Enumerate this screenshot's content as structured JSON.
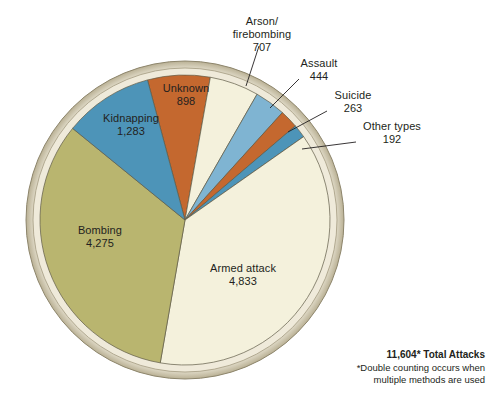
{
  "chart_data": {
    "type": "pie",
    "title": "",
    "total_label": "11,604* Total Attacks",
    "total_value": 11604,
    "footnote": "*Double counting occurs when multiple methods are used",
    "categories": [
      "Unknown",
      "Arson/firebombing",
      "Assault",
      "Suicide",
      "Other types",
      "Armed attack",
      "Bombing",
      "Kidnapping"
    ],
    "values": [
      898,
      707,
      444,
      263,
      192,
      4833,
      4275,
      1283
    ],
    "value_labels": [
      "898",
      "707",
      "444",
      "263",
      "192",
      "4,833",
      "4,275",
      "1,283"
    ],
    "colors": [
      "#c4682f",
      "#f4f1dc",
      "#7fb4d2",
      "#c4682f",
      "#4d94b8",
      "#f4f1dc",
      "#b9b56f",
      "#4d94b8"
    ],
    "legend": "none",
    "grid": false
  },
  "slices": [
    {
      "name": "unknown",
      "label": "Unknown",
      "value_label": "898",
      "value": 898,
      "color": "#c4682f",
      "label_x": 185,
      "label_y": 88,
      "inside": true
    },
    {
      "name": "arson-firebombing",
      "label": "Arson/",
      "label2": "firebombing",
      "value_label": "707",
      "value": 707,
      "color": "#f4f1dc",
      "inside": false
    },
    {
      "name": "assault",
      "label": "Assault",
      "value_label": "444",
      "value": 444,
      "color": "#7fb4d2",
      "inside": false
    },
    {
      "name": "suicide",
      "label": "Suicide",
      "value_label": "263",
      "value": 263,
      "color": "#c4682f",
      "inside": false
    },
    {
      "name": "other-types",
      "label": "Other types",
      "value_label": "192",
      "value": 192,
      "color": "#4d94b8",
      "inside": false
    },
    {
      "name": "armed-attack",
      "label": "Armed attack",
      "value_label": "4,833",
      "value": 4833,
      "color": "#f4f1dc",
      "label_x": 243,
      "label_y": 267,
      "inside": true
    },
    {
      "name": "bombing",
      "label": "Bombing",
      "value_label": "4,275",
      "value": 4275,
      "color": "#b9b56f",
      "label_x": 100,
      "label_y": 228,
      "inside": true
    },
    {
      "name": "kidnapping",
      "label": "Kidnapping",
      "value_label": "1,283",
      "value": 1283,
      "color": "#4d94b8",
      "label_x": 128,
      "label_y": 117,
      "inside": true
    }
  ],
  "callouts": {
    "arson": {
      "line1": "Arson/",
      "line2": "firebombing",
      "value": "707"
    },
    "assault": {
      "line1": "Assault",
      "value": "444"
    },
    "suicide": {
      "line1": "Suicide",
      "value": "263"
    },
    "other": {
      "line1": "Other types",
      "value": "192"
    }
  },
  "footer": {
    "total": "11,604* Total Attacks",
    "note_line1": "*Double counting occurs when",
    "note_line2": "multiple methods are used"
  },
  "style": {
    "background": "#ffffff",
    "rim_outer": "#b5ad8a",
    "rim_inner": "#efeada",
    "stroke": "#6b6450"
  }
}
